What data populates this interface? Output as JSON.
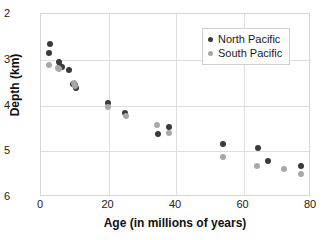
{
  "chart_data": {
    "type": "scatter",
    "title": "",
    "xlabel": "Age (in millions of years)",
    "ylabel": "Depth (km)",
    "xlim": [
      0,
      80
    ],
    "ylim": [
      2,
      6
    ],
    "y_inverted": true,
    "grid": true,
    "legend_position": "top-right",
    "xticks": [
      0,
      20,
      40,
      60,
      80
    ],
    "yticks": [
      2,
      3,
      4,
      5,
      6
    ],
    "xtick_labels": [
      "0",
      "20",
      "40",
      "60",
      "80"
    ],
    "ytick_labels": [
      "2",
      "3",
      "4",
      "5",
      "6"
    ],
    "series": [
      {
        "name": "North Pacific",
        "color": "#3a3a3a",
        "points": [
          {
            "x": 2.6,
            "y": 2.66
          },
          {
            "x": 2.4,
            "y": 2.85
          },
          {
            "x": 5.2,
            "y": 3.05
          },
          {
            "x": 5.6,
            "y": 3.14
          },
          {
            "x": 6.3,
            "y": 3.16
          },
          {
            "x": 8.4,
            "y": 3.22
          },
          {
            "x": 9.6,
            "y": 3.52
          },
          {
            "x": 10.1,
            "y": 3.56
          },
          {
            "x": 10.4,
            "y": 3.62
          },
          {
            "x": 19.8,
            "y": 3.95
          },
          {
            "x": 25.0,
            "y": 4.16
          },
          {
            "x": 34.6,
            "y": 4.62
          },
          {
            "x": 37.8,
            "y": 4.46
          },
          {
            "x": 53.8,
            "y": 4.85
          },
          {
            "x": 64.2,
            "y": 4.93
          },
          {
            "x": 67.3,
            "y": 5.22
          },
          {
            "x": 77.0,
            "y": 5.32
          }
        ]
      },
      {
        "name": "South Pacific",
        "color": "#a8a8a8",
        "points": [
          {
            "x": 2.3,
            "y": 3.12
          },
          {
            "x": 4.9,
            "y": 3.18
          },
          {
            "x": 5.4,
            "y": 3.2
          },
          {
            "x": 9.8,
            "y": 3.5
          },
          {
            "x": 10.0,
            "y": 3.58
          },
          {
            "x": 19.9,
            "y": 4.04
          },
          {
            "x": 25.1,
            "y": 4.24
          },
          {
            "x": 34.3,
            "y": 4.42
          },
          {
            "x": 38.0,
            "y": 4.6
          },
          {
            "x": 53.9,
            "y": 5.12
          },
          {
            "x": 64.0,
            "y": 5.32
          },
          {
            "x": 72.1,
            "y": 5.38
          },
          {
            "x": 77.1,
            "y": 5.5
          }
        ]
      }
    ]
  }
}
